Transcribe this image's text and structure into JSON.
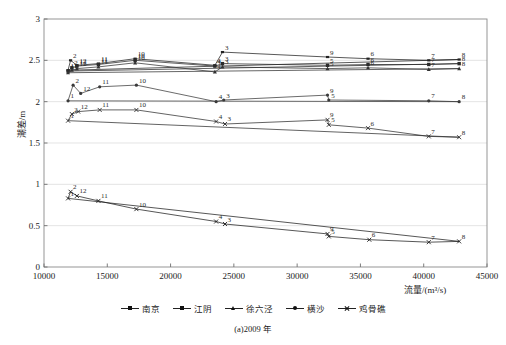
{
  "chart_data": {
    "type": "line",
    "title": "",
    "caption": "(a)2009 年",
    "xlabel": "流量/(m³/s)",
    "ylabel": "潮差/m",
    "xlim": [
      10000,
      45000
    ],
    "ylim": [
      0,
      3
    ],
    "xticks": [
      10000,
      15000,
      20000,
      25000,
      30000,
      35000,
      40000,
      45000
    ],
    "xtick_labels": [
      "10000",
      "15000",
      "20000",
      "25000",
      "30000",
      "35000",
      "40000",
      "45000"
    ],
    "yticks": [
      0,
      0.5,
      1,
      1.5,
      2,
      2.5,
      3
    ],
    "ytick_labels": [
      "0",
      "0.5",
      "1",
      "1.5",
      "2",
      "2.5",
      "3"
    ],
    "grid": "horizontal",
    "legend_position": "bottom",
    "point_labels_are_months": true,
    "series": [
      {
        "name": "南京",
        "marker": "line-dash",
        "color": "#222222",
        "points": [
          {
            "label": "1",
            "x": 11900,
            "y": 2.38
          },
          {
            "label": "2",
            "x": 12100,
            "y": 2.5
          },
          {
            "label": "12",
            "x": 12600,
            "y": 2.44
          },
          {
            "label": "11",
            "x": 14300,
            "y": 2.46
          },
          {
            "label": "10",
            "x": 17200,
            "y": 2.52
          },
          {
            "label": "4",
            "x": 23500,
            "y": 2.44
          },
          {
            "label": "3",
            "x": 24100,
            "y": 2.6
          },
          {
            "label": "9",
            "x": 32400,
            "y": 2.54
          },
          {
            "label": "6",
            "x": 35600,
            "y": 2.52
          },
          {
            "label": "7",
            "x": 40400,
            "y": 2.5
          },
          {
            "label": "8",
            "x": 42800,
            "y": 2.51
          }
        ]
      },
      {
        "name": "江阴",
        "marker": "square",
        "color": "#2b2b2b",
        "points": [
          {
            "label": "1",
            "x": 11900,
            "y": 2.37
          },
          {
            "label": "2",
            "x": 12200,
            "y": 2.41
          },
          {
            "label": "12",
            "x": 12600,
            "y": 2.43
          },
          {
            "label": "11",
            "x": 14300,
            "y": 2.45
          },
          {
            "label": "10",
            "x": 17200,
            "y": 2.5
          },
          {
            "label": "4",
            "x": 23500,
            "y": 2.43
          },
          {
            "label": "3",
            "x": 24100,
            "y": 2.46
          },
          {
            "label": "5",
            "x": 32400,
            "y": 2.44
          },
          {
            "label": "6",
            "x": 35600,
            "y": 2.45
          },
          {
            "label": "7",
            "x": 40400,
            "y": 2.45
          },
          {
            "label": "8",
            "x": 42800,
            "y": 2.46
          }
        ]
      },
      {
        "name": "徐六泾",
        "marker": "triangle",
        "color": "#333333",
        "points": [
          {
            "label": "1",
            "x": 11900,
            "y": 2.35
          },
          {
            "label": "2",
            "x": 12200,
            "y": 2.38
          },
          {
            "label": "12",
            "x": 12600,
            "y": 2.4
          },
          {
            "label": "11",
            "x": 14300,
            "y": 2.42
          },
          {
            "label": "10",
            "x": 17200,
            "y": 2.47
          },
          {
            "label": "4",
            "x": 23500,
            "y": 2.36
          },
          {
            "label": "3",
            "x": 24100,
            "y": 2.42
          },
          {
            "label": "5",
            "x": 32400,
            "y": 2.4
          },
          {
            "label": "6",
            "x": 35600,
            "y": 2.41
          },
          {
            "label": "7",
            "x": 40400,
            "y": 2.39
          },
          {
            "label": "8",
            "x": 42800,
            "y": 2.4
          }
        ]
      },
      {
        "name": "横沙",
        "marker": "dot",
        "color": "#3a3a3a",
        "points": [
          {
            "label": "1",
            "x": 11900,
            "y": 2.01
          },
          {
            "label": "2",
            "x": 12300,
            "y": 2.2
          },
          {
            "label": "12",
            "x": 12900,
            "y": 2.1
          },
          {
            "label": "11",
            "x": 14400,
            "y": 2.18
          },
          {
            "label": "10",
            "x": 17300,
            "y": 2.2
          },
          {
            "label": "4",
            "x": 23600,
            "y": 2.0
          },
          {
            "label": "3",
            "x": 24200,
            "y": 2.02
          },
          {
            "label": "9",
            "x": 32400,
            "y": 2.08
          },
          {
            "label": "5",
            "x": 32500,
            "y": 2.02
          },
          {
            "label": "7",
            "x": 40400,
            "y": 2.01
          },
          {
            "label": "8",
            "x": 42800,
            "y": 2.0
          }
        ]
      },
      {
        "name": "鸡骨礁",
        "marker": "cross",
        "color": "#2f2f2f",
        "points": [
          {
            "label": "1",
            "x": 11900,
            "y": 1.77
          },
          {
            "label": "2",
            "x": 12200,
            "y": 1.85
          },
          {
            "label": "12",
            "x": 12700,
            "y": 1.88
          },
          {
            "label": "11",
            "x": 14400,
            "y": 1.9
          },
          {
            "label": "10",
            "x": 17300,
            "y": 1.9
          },
          {
            "label": "4",
            "x": 23600,
            "y": 1.76
          },
          {
            "label": "3",
            "x": 24300,
            "y": 1.73
          },
          {
            "label": "9",
            "x": 32400,
            "y": 1.78
          },
          {
            "label": "5",
            "x": 32500,
            "y": 1.72
          },
          {
            "label": "6",
            "x": 35600,
            "y": 1.68
          },
          {
            "label": "7",
            "x": 40400,
            "y": 1.58
          },
          {
            "label": "8",
            "x": 42800,
            "y": 1.57
          }
        ]
      },
      {
        "name": "鸡骨礁-低",
        "marker": "cross",
        "color": "#1f1f1f",
        "points": [
          {
            "label": "1",
            "x": 11900,
            "y": 0.83
          },
          {
            "label": "2",
            "x": 12100,
            "y": 0.91
          },
          {
            "label": "12",
            "x": 12600,
            "y": 0.86
          },
          {
            "label": "11",
            "x": 14300,
            "y": 0.8
          },
          {
            "label": "10",
            "x": 17300,
            "y": 0.7
          },
          {
            "label": "4",
            "x": 23600,
            "y": 0.55
          },
          {
            "label": "3",
            "x": 24300,
            "y": 0.52
          },
          {
            "label": "9",
            "x": 32400,
            "y": 0.4
          },
          {
            "label": "5",
            "x": 32500,
            "y": 0.37
          },
          {
            "label": "6",
            "x": 35700,
            "y": 0.33
          },
          {
            "label": "7",
            "x": 40400,
            "y": 0.3
          },
          {
            "label": "8",
            "x": 42800,
            "y": 0.31
          }
        ]
      }
    ]
  },
  "legend": {
    "items": [
      {
        "label": "南京",
        "marker": "dash"
      },
      {
        "label": "江阴",
        "marker": "square"
      },
      {
        "label": "徐六泾",
        "marker": "triangle"
      },
      {
        "label": "横沙",
        "marker": "dot"
      },
      {
        "label": "鸡骨礁",
        "marker": "cross"
      }
    ]
  }
}
